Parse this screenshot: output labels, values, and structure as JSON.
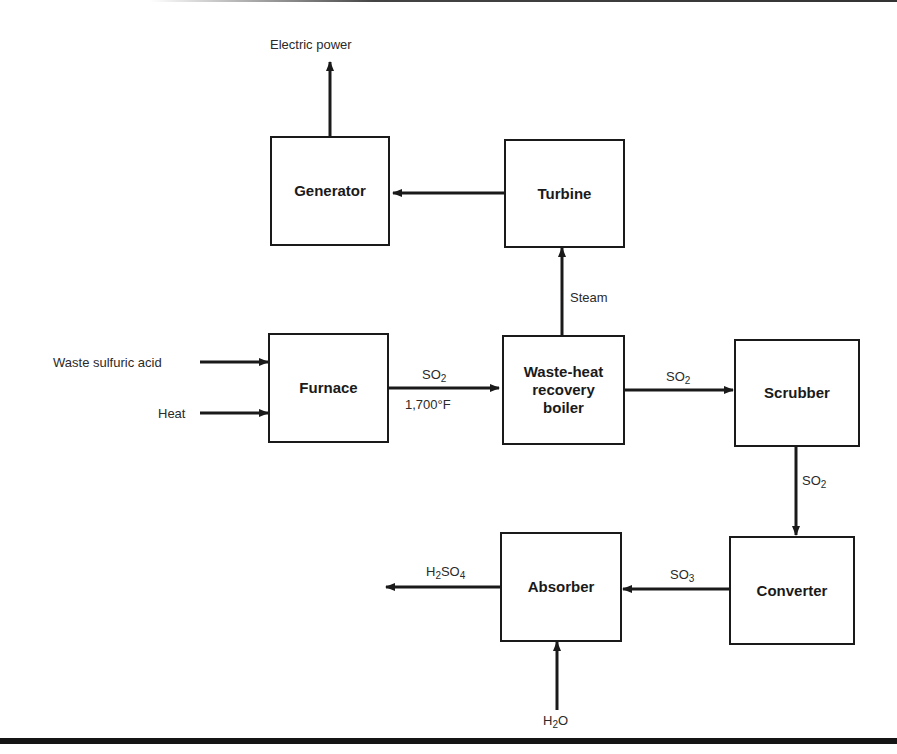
{
  "diagram": {
    "nodes": [
      {
        "id": "generator",
        "label": "Generator"
      },
      {
        "id": "turbine",
        "label": "Turbine"
      },
      {
        "id": "furnace",
        "label": "Furnace"
      },
      {
        "id": "boiler",
        "label": "Waste-heat recovery boiler",
        "lines": [
          "Waste-heat",
          "recovery",
          "boiler"
        ]
      },
      {
        "id": "scrubber",
        "label": "Scrubber"
      },
      {
        "id": "converter",
        "label": "Converter"
      },
      {
        "id": "absorber",
        "label": "Absorber"
      }
    ],
    "edges": [
      {
        "from": "generator",
        "to": "output",
        "label": "Electric power"
      },
      {
        "from": "turbine",
        "to": "generator",
        "label": ""
      },
      {
        "from": "boiler",
        "to": "turbine",
        "label": "Steam"
      },
      {
        "from": "input",
        "to": "furnace",
        "label": "Waste sulfuric acid"
      },
      {
        "from": "input",
        "to": "furnace",
        "label": "Heat"
      },
      {
        "from": "furnace",
        "to": "boiler",
        "label": "SO2",
        "sublabel": "1,700°F"
      },
      {
        "from": "boiler",
        "to": "scrubber",
        "label": "SO2"
      },
      {
        "from": "scrubber",
        "to": "converter",
        "label": "SO2"
      },
      {
        "from": "converter",
        "to": "absorber",
        "label": "SO3"
      },
      {
        "from": "absorber",
        "to": "output",
        "label": "H2SO4"
      },
      {
        "from": "input",
        "to": "absorber",
        "label": "H2O"
      }
    ],
    "labels": {
      "electric_power": "Electric power",
      "steam": "Steam",
      "waste_acid": "Waste sulfuric acid",
      "heat": "Heat",
      "so2_furnace_base": "SO",
      "so2_furnace_sub": "2",
      "temperature": "1,700°F",
      "so2_boiler_base": "SO",
      "so2_boiler_sub": "2",
      "so2_scrubber_base": "SO",
      "so2_scrubber_sub": "2",
      "so3_base": "SO",
      "so3_sub": "3",
      "h2so4_h": "H",
      "h2so4_sub1": "2",
      "h2so4_so": "SO",
      "h2so4_sub2": "4",
      "h2o_h": "H",
      "h2o_sub": "2",
      "h2o_o": "O"
    }
  }
}
